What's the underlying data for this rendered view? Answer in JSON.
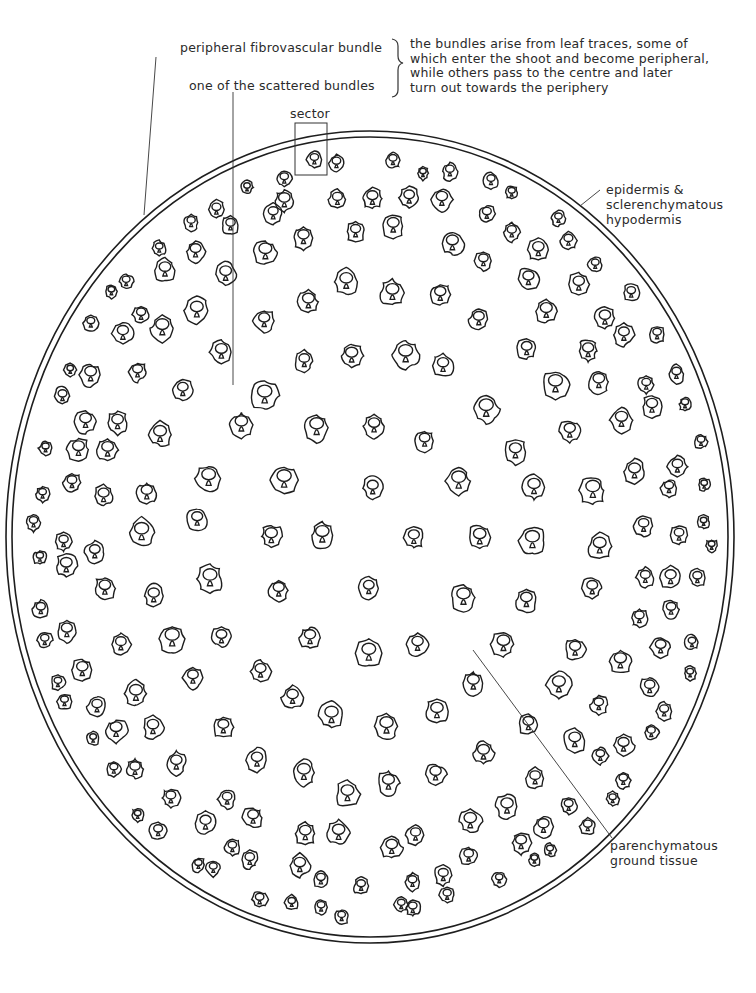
{
  "figure": {
    "type": "botanical transverse section drawing"
  },
  "labels": {
    "peripheral_bundle": "peripheral fibrovascular bundle",
    "scattered_bundle": "one of the scattered bundles",
    "sector": "sector",
    "epidermis_line1": "epidermis &",
    "epidermis_line2": "sclerenchymatous",
    "epidermis_line3": "hypodermis",
    "ground_line1": "parenchymatous",
    "ground_line2": "ground tissue"
  },
  "note": {
    "lines": [
      "the bundles arise from leaf traces, some of",
      "which enter the shoot and become peripheral,",
      "while others pass to the centre and later",
      "turn out towards the periphery"
    ]
  },
  "colors": {
    "ink": "#1e1e1e",
    "paper": "#ffffff"
  }
}
